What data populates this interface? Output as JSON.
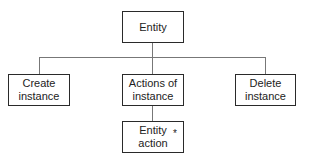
{
  "diagram": {
    "type": "jackson-structure-diagram",
    "root": {
      "label": "Entity"
    },
    "children": [
      {
        "label": "Create instance",
        "line1": "Create",
        "line2": "instance"
      },
      {
        "label": "Actions of instance",
        "line1": "Actions of",
        "line2": "instance"
      },
      {
        "label": "Delete instance",
        "line1": "Delete",
        "line2": "instance"
      }
    ],
    "grandchild": {
      "label": "Entity action",
      "line1": "Entity",
      "line2": "action",
      "marker": "*"
    },
    "colors": {
      "border": "#2a2a2a",
      "connector": "#777777",
      "background": "#ffffff"
    }
  }
}
